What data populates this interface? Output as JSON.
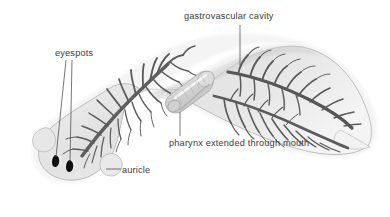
{
  "figure": {
    "background_color": "#ffffff",
    "width": 390,
    "height": 217,
    "label_color": "#3b3b3b",
    "leader_color": "#4a4a4a"
  },
  "labels": {
    "gastrovascular_cavity": "gastrovascular cavity",
    "eyespots": "eyespots",
    "pharynx": "pharynx extended through mouth",
    "auricle": "auricle"
  },
  "anatomy": {
    "body_fill": "#e9e9e9",
    "body_outline": "#9a9a9a",
    "cavity_color": "#5a5a5a",
    "eyespot_color": "#111111",
    "pharynx_fill": "#d8d8d8",
    "highlight_color": "#fcfcfc",
    "parts": [
      {
        "name": "gastrovascular cavity",
        "description": "branched digestive cavity extending anteriorly and posteriorly",
        "leader_from": [
          240,
          25
        ],
        "leader_to": [
          240,
          66
        ]
      },
      {
        "name": "eyespots",
        "description": "two pigmented light-sensitive spots on the head",
        "leader_from": [
          66,
          60
        ],
        "leader_to": [
          56,
          160
        ],
        "leader_from_2": [
          72,
          60
        ],
        "leader_to_2": [
          70,
          165
        ]
      },
      {
        "name": "pharynx extended through mouth",
        "description": "muscular tube projecting ventrally from mid-body",
        "leader_from": [
          180,
          136
        ],
        "leader_to": [
          180,
          112
        ]
      },
      {
        "name": "auricle",
        "description": "lateral lobe-like sensory projection of the head",
        "leader_from": [
          121,
          169
        ],
        "leader_to": [
          106,
          169
        ]
      }
    ]
  }
}
